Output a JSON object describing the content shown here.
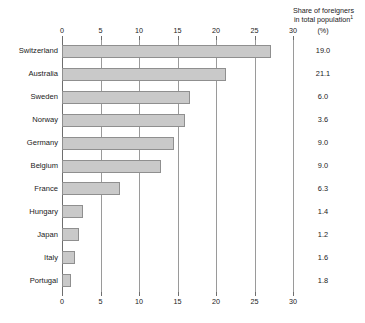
{
  "chart_data": {
    "type": "bar",
    "orientation": "horizontal",
    "title": "",
    "xlabel": "",
    "ylabel": "",
    "xlim": [
      0,
      30
    ],
    "xticks": [
      0,
      5,
      10,
      15,
      20,
      25,
      30
    ],
    "xtick_labels": [
      "0",
      "5",
      "10",
      "15",
      "20",
      "25",
      "30"
    ],
    "grid": true,
    "axis_positions": [
      "top",
      "bottom"
    ],
    "legend": "none",
    "categories": [
      "Switzerland",
      "Australia",
      "Sweden",
      "Norway",
      "Germany",
      "Belgium",
      "France",
      "Hungary",
      "Japan",
      "Italy",
      "Portugal"
    ],
    "values": [
      27.1,
      21.3,
      16.6,
      16.0,
      14.5,
      12.8,
      7.5,
      2.7,
      2.2,
      1.7,
      1.2
    ],
    "series": [
      {
        "name": "bar-length",
        "values": [
          27.1,
          21.3,
          16.6,
          16.0,
          14.5,
          12.8,
          7.5,
          2.7,
          2.2,
          1.7,
          1.2
        ]
      },
      {
        "name": "Share of foreigners in total population (%)",
        "values": [
          19.0,
          21.1,
          6.0,
          3.6,
          9.0,
          9.0,
          6.3,
          1.4,
          1.2,
          1.6,
          1.8
        ]
      }
    ],
    "annotations": {
      "right_column_header_line1": "Share of foreigners",
      "right_column_header_line2": "in total population",
      "right_column_header_superscript": "1",
      "right_column_units": "(%)"
    },
    "value_labels": [
      "19.0",
      "21.1",
      "6.0",
      "3.6",
      "9.0",
      "9.0",
      "6.3",
      "1.4",
      "1.2",
      "1.6",
      "1.8"
    ],
    "colors": {
      "bar_fill": "#c9c9c9",
      "bar_border": "#8f8f8f",
      "gridline": "#9a9a9a",
      "axis": "#6e6e6e",
      "text": "#1a1a1a",
      "background": "#ffffff"
    }
  }
}
